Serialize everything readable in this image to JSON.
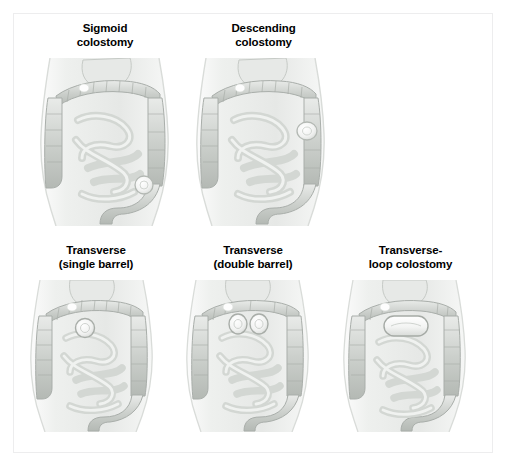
{
  "figure": {
    "type": "medical-illustration",
    "background_color": "#ffffff",
    "frame_color": "#ededee",
    "rows": 2,
    "palette": {
      "skin_light": "#f2f3f2",
      "skin_mid": "#e2e4e2",
      "skin_shadow": "#cfd2cf",
      "colon_light": "#e4e6e4",
      "colon_mid": "#c9cdc9",
      "colon_dark": "#aeb3ae",
      "bowel_light": "#e8eae8",
      "bowel_mid": "#ccd0cc",
      "stoma_fill": "#fafbfa",
      "stoma_edge": "#b9bdb9",
      "outline": "#9fa4a0"
    },
    "panels": [
      {
        "id": "sigmoid",
        "row": 1,
        "caption_lines": [
          "Sigmoid",
          "colostomy"
        ],
        "stoma": {
          "shape": "circle",
          "count": 1,
          "location": "lower left abdomen (sigmoid colon)",
          "cx": 124,
          "cy": 127,
          "r": 9
        }
      },
      {
        "id": "descending",
        "row": 1,
        "caption_lines": [
          "Descending",
          "colostomy"
        ],
        "stoma": {
          "shape": "oval",
          "count": 1,
          "location": "left mid abdomen (descending colon)",
          "cx": 131,
          "cy": 73,
          "rx": 10,
          "ry": 9
        }
      },
      {
        "id": "transverse-single-barrel",
        "row": 2,
        "caption_lines": [
          "Transverse",
          "(single barrel)"
        ],
        "stoma": {
          "shape": "circle",
          "count": 1,
          "location": "upper mid abdomen (transverse colon)",
          "cx": 69,
          "cy": 48,
          "r": 9
        }
      },
      {
        "id": "transverse-double-barrel",
        "row": 2,
        "caption_lines": [
          "Transverse",
          "(double barrel)"
        ],
        "stoma": {
          "shape": "double-oval",
          "count": 2,
          "location": "upper mid abdomen (transverse colon), two adjacent openings",
          "cx1": 66,
          "cx2": 87,
          "cy": 44,
          "rx": 9,
          "ry": 10
        }
      },
      {
        "id": "transverse-loop",
        "row": 2,
        "caption_lines": [
          "Transverse-",
          "loop colostomy"
        ],
        "stoma": {
          "shape": "elongated-loop",
          "count": 1,
          "location": "upper mid abdomen (transverse colon), wide loop",
          "x": 55,
          "y": 36,
          "w": 44,
          "h": 20
        }
      }
    ]
  }
}
